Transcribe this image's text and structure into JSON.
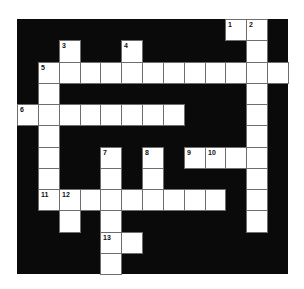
{
  "puzzle": {
    "type": "crossword",
    "cols": 13,
    "rows": 12,
    "colors": {
      "block": "#0a0a0a",
      "cell": "#ffffff",
      "grid_line": "#6e6e6e",
      "number": "#111111"
    },
    "white_cells": [
      [
        0,
        10
      ],
      [
        0,
        11
      ],
      [
        1,
        2
      ],
      [
        1,
        5
      ],
      [
        1,
        11
      ],
      [
        2,
        1
      ],
      [
        2,
        2
      ],
      [
        2,
        3
      ],
      [
        2,
        4
      ],
      [
        2,
        5
      ],
      [
        2,
        6
      ],
      [
        2,
        7
      ],
      [
        2,
        8
      ],
      [
        2,
        9
      ],
      [
        2,
        10
      ],
      [
        2,
        11
      ],
      [
        2,
        12
      ],
      [
        3,
        1
      ],
      [
        3,
        11
      ],
      [
        4,
        0
      ],
      [
        4,
        1
      ],
      [
        4,
        2
      ],
      [
        4,
        3
      ],
      [
        4,
        4
      ],
      [
        4,
        5
      ],
      [
        4,
        6
      ],
      [
        4,
        7
      ],
      [
        4,
        11
      ],
      [
        5,
        1
      ],
      [
        5,
        11
      ],
      [
        6,
        1
      ],
      [
        6,
        4
      ],
      [
        6,
        6
      ],
      [
        6,
        8
      ],
      [
        6,
        9
      ],
      [
        6,
        10
      ],
      [
        6,
        11
      ],
      [
        7,
        1
      ],
      [
        7,
        4
      ],
      [
        7,
        6
      ],
      [
        7,
        11
      ],
      [
        8,
        1
      ],
      [
        8,
        2
      ],
      [
        8,
        3
      ],
      [
        8,
        4
      ],
      [
        8,
        5
      ],
      [
        8,
        6
      ],
      [
        8,
        7
      ],
      [
        8,
        8
      ],
      [
        8,
        9
      ],
      [
        8,
        11
      ],
      [
        9,
        2
      ],
      [
        9,
        4
      ],
      [
        9,
        11
      ],
      [
        10,
        4
      ],
      [
        10,
        5
      ],
      [
        11,
        4
      ]
    ],
    "numbers": [
      {
        "r": 0,
        "c": 10,
        "n": "1"
      },
      {
        "r": 0,
        "c": 11,
        "n": "2"
      },
      {
        "r": 1,
        "c": 2,
        "n": "3"
      },
      {
        "r": 1,
        "c": 5,
        "n": "4"
      },
      {
        "r": 2,
        "c": 1,
        "n": "5"
      },
      {
        "r": 4,
        "c": 0,
        "n": "6"
      },
      {
        "r": 6,
        "c": 4,
        "n": "7"
      },
      {
        "r": 6,
        "c": 6,
        "n": "8"
      },
      {
        "r": 6,
        "c": 8,
        "n": "9"
      },
      {
        "r": 6,
        "c": 9,
        "n": "10"
      },
      {
        "r": 8,
        "c": 1,
        "n": "11"
      },
      {
        "r": 8,
        "c": 2,
        "n": "12"
      },
      {
        "r": 10,
        "c": 4,
        "n": "13"
      }
    ]
  }
}
